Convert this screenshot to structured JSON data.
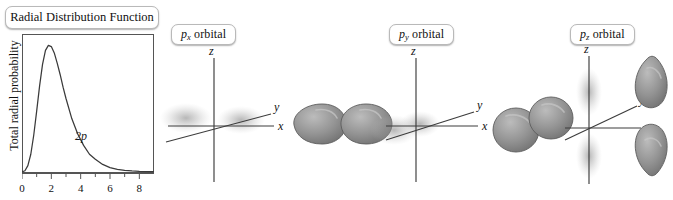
{
  "figure": {
    "background": "#ffffff",
    "ink": "#111111",
    "lobe_fill": "#8d8d8d",
    "lobe_edge": "#5a5a5a",
    "lobe_highlight": "#b5b5b5",
    "cloud_color": "#9a9a9a",
    "panels": [
      {
        "id": "px",
        "label_prefix": "p",
        "label_sub": "x",
        "label_suffix": " orbital"
      },
      {
        "id": "py",
        "label_prefix": "p",
        "label_sub": "y",
        "label_suffix": " orbital"
      },
      {
        "id": "pz",
        "label_prefix": "p",
        "label_sub": "z",
        "label_suffix": " orbital"
      }
    ],
    "axis_labels": {
      "x": "x",
      "y": "y",
      "z": "z"
    }
  },
  "rdf": {
    "title": "Radial Distribution Function",
    "curve_label": "2p"
  },
  "chart_data": {
    "type": "line",
    "title": "Radial Distribution Function",
    "xlabel": "",
    "ylabel": "Total radial probability",
    "xlim": [
      0,
      9
    ],
    "ylim": [
      0,
      1.05
    ],
    "grid": false,
    "legend": "none",
    "xticks": [
      0,
      2,
      4,
      6,
      8
    ],
    "xticklabels": [
      "0",
      "2",
      "4",
      "6",
      "8"
    ],
    "yticks": [],
    "yticklabels": [],
    "annotations": [
      {
        "text": "2p",
        "x": 4.0,
        "y": 0.3
      }
    ],
    "series": [
      {
        "name": "2p",
        "x": [
          0.0,
          0.2,
          0.4,
          0.6,
          0.8,
          1.0,
          1.2,
          1.4,
          1.6,
          1.8,
          2.0,
          2.2,
          2.4,
          2.6,
          2.8,
          3.0,
          3.4,
          3.8,
          4.2,
          4.6,
          5.0,
          5.5,
          6.0,
          6.5,
          7.0,
          7.5,
          8.0,
          8.6,
          9.0
        ],
        "y": [
          0.0,
          0.01,
          0.05,
          0.14,
          0.29,
          0.48,
          0.68,
          0.85,
          0.96,
          1.0,
          0.99,
          0.94,
          0.86,
          0.77,
          0.67,
          0.58,
          0.42,
          0.3,
          0.21,
          0.14,
          0.1,
          0.06,
          0.035,
          0.021,
          0.013,
          0.008,
          0.005,
          0.003,
          0.002
        ]
      }
    ]
  }
}
